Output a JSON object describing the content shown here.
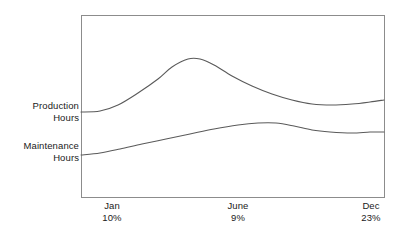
{
  "chart_data": {
    "type": "line",
    "title": "",
    "xlabel": "",
    "ylabel": "",
    "grid": false,
    "legend_position": "left-inline",
    "frame": {
      "x0": 81,
      "y0": 15,
      "x1": 384,
      "y1": 197
    },
    "categories": [
      "Jan",
      "June",
      "Dec"
    ],
    "category_percents": [
      "10%",
      "9%",
      "23%"
    ],
    "series": [
      {
        "name": "Production Hours",
        "label_line1": "Production",
        "label_line2": "Hours",
        "color": "#5a5a5a",
        "points": [
          {
            "x": 81,
            "y": 112
          },
          {
            "x": 100,
            "y": 111
          },
          {
            "x": 118,
            "y": 105
          },
          {
            "x": 138,
            "y": 93
          },
          {
            "x": 158,
            "y": 79
          },
          {
            "x": 172,
            "y": 67
          },
          {
            "x": 188,
            "y": 59
          },
          {
            "x": 200,
            "y": 59
          },
          {
            "x": 214,
            "y": 65
          },
          {
            "x": 232,
            "y": 76
          },
          {
            "x": 252,
            "y": 86
          },
          {
            "x": 272,
            "y": 94
          },
          {
            "x": 292,
            "y": 100
          },
          {
            "x": 312,
            "y": 104
          },
          {
            "x": 332,
            "y": 105
          },
          {
            "x": 352,
            "y": 104
          },
          {
            "x": 370,
            "y": 102
          },
          {
            "x": 384,
            "y": 100
          }
        ]
      },
      {
        "name": "Maintenance Hours",
        "label_line1": "Maintenance",
        "label_line2": "Hours",
        "color": "#5a5a5a",
        "points": [
          {
            "x": 81,
            "y": 155
          },
          {
            "x": 100,
            "y": 153
          },
          {
            "x": 120,
            "y": 149
          },
          {
            "x": 142,
            "y": 144
          },
          {
            "x": 166,
            "y": 139
          },
          {
            "x": 190,
            "y": 134
          },
          {
            "x": 214,
            "y": 129
          },
          {
            "x": 238,
            "y": 125
          },
          {
            "x": 258,
            "y": 123
          },
          {
            "x": 276,
            "y": 123
          },
          {
            "x": 294,
            "y": 126
          },
          {
            "x": 312,
            "y": 130
          },
          {
            "x": 330,
            "y": 132
          },
          {
            "x": 352,
            "y": 133
          },
          {
            "x": 370,
            "y": 132
          },
          {
            "x": 384,
            "y": 132
          }
        ]
      }
    ],
    "frame_color": "#8c8c8c",
    "text_color": "#1a1a1a",
    "background": "#ffffff"
  }
}
